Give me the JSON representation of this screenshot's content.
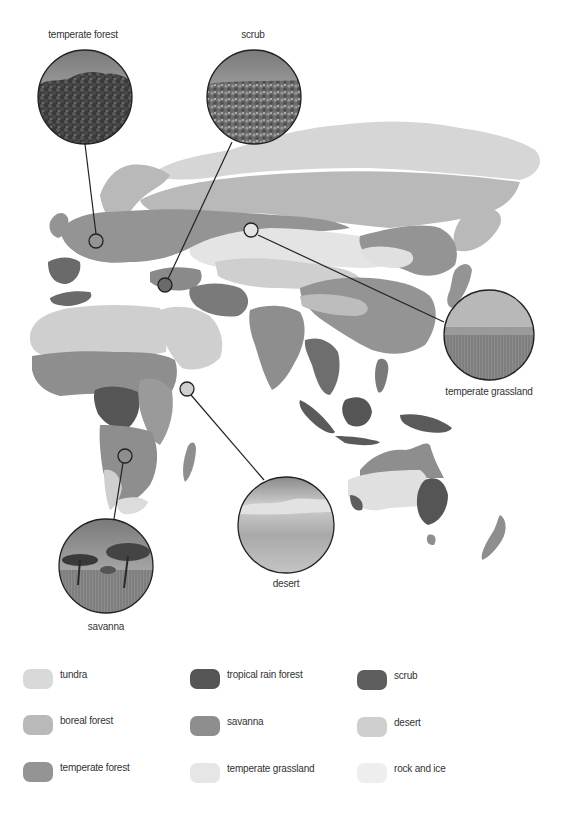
{
  "map": {
    "callouts": [
      {
        "id": "temperate-forest",
        "label": "temperate forest",
        "photo_cx": 85,
        "photo_cy": 97,
        "r": 47,
        "marker_cx": 96,
        "marker_cy": 241,
        "label_x": 83,
        "label_y": 34
      },
      {
        "id": "scrub",
        "label": "scrub",
        "photo_cx": 254,
        "photo_cy": 97,
        "r": 47,
        "marker_cx": 165,
        "marker_cy": 285,
        "label_x": 253,
        "label_y": 34
      },
      {
        "id": "temperate-grassland",
        "label": "temperate grassland",
        "photo_cx": 489,
        "photo_cy": 335,
        "r": 45,
        "marker_cx": 251,
        "marker_cy": 230,
        "label_x": 489,
        "label_y": 391
      },
      {
        "id": "desert",
        "label": "desert",
        "photo_cx": 286,
        "photo_cy": 525,
        "r": 48,
        "marker_cx": 187,
        "marker_cy": 389,
        "label_x": 286,
        "label_y": 583
      },
      {
        "id": "savanna",
        "label": "savanna",
        "photo_cx": 106,
        "photo_cy": 566,
        "r": 47,
        "marker_cx": 125,
        "marker_cy": 456,
        "label_x": 106,
        "label_y": 626
      }
    ]
  },
  "legend": {
    "items": [
      {
        "label": "tundra",
        "color": "#d9d9d9"
      },
      {
        "label": "tropical rain forest",
        "color": "#555555"
      },
      {
        "label": "scrub",
        "color": "#5e5e5e"
      },
      {
        "label": "boreal forest",
        "color": "#b9b9b9"
      },
      {
        "label": "savanna",
        "color": "#8e8e8e"
      },
      {
        "label": "desert",
        "color": "#cfcfcf"
      },
      {
        "label": "temperate forest",
        "color": "#949494"
      },
      {
        "label": "temperate grassland",
        "color": "#e6e6e6"
      },
      {
        "label": "rock and ice",
        "color": "#eeeeee"
      }
    ]
  }
}
